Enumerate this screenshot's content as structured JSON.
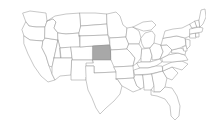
{
  "map": {
    "title": "United States map",
    "region_scope": "Contiguous United States",
    "background_color": "#ffffff",
    "state_fill_color": "#ffffff",
    "state_border_color": "#9a9a9a",
    "highlight_fill_color": "#a8a8a8",
    "highlight_border_color": "#8d8d8d",
    "shadow_color": "#7c7c7c",
    "highlighted_state": {
      "name": "Kansas",
      "abbreviation": "KS",
      "selected": true
    },
    "projection_note": "equirectangular-style flat outline",
    "states": [
      {
        "abbr": "WA",
        "name": "Washington",
        "highlighted": false
      },
      {
        "abbr": "OR",
        "name": "Oregon",
        "highlighted": false
      },
      {
        "abbr": "CA",
        "name": "California",
        "highlighted": false
      },
      {
        "abbr": "NV",
        "name": "Nevada",
        "highlighted": false
      },
      {
        "abbr": "ID",
        "name": "Idaho",
        "highlighted": false
      },
      {
        "abbr": "MT",
        "name": "Montana",
        "highlighted": false
      },
      {
        "abbr": "WY",
        "name": "Wyoming",
        "highlighted": false
      },
      {
        "abbr": "UT",
        "name": "Utah",
        "highlighted": false
      },
      {
        "abbr": "AZ",
        "name": "Arizona",
        "highlighted": false
      },
      {
        "abbr": "CO",
        "name": "Colorado",
        "highlighted": false
      },
      {
        "abbr": "NM",
        "name": "New Mexico",
        "highlighted": false
      },
      {
        "abbr": "ND",
        "name": "North Dakota",
        "highlighted": false
      },
      {
        "abbr": "SD",
        "name": "South Dakota",
        "highlighted": false
      },
      {
        "abbr": "NE",
        "name": "Nebraska",
        "highlighted": false
      },
      {
        "abbr": "KS",
        "name": "Kansas",
        "highlighted": true
      },
      {
        "abbr": "OK",
        "name": "Oklahoma",
        "highlighted": false
      },
      {
        "abbr": "TX",
        "name": "Texas",
        "highlighted": false
      },
      {
        "abbr": "MN",
        "name": "Minnesota",
        "highlighted": false
      },
      {
        "abbr": "IA",
        "name": "Iowa",
        "highlighted": false
      },
      {
        "abbr": "MO",
        "name": "Missouri",
        "highlighted": false
      },
      {
        "abbr": "AR",
        "name": "Arkansas",
        "highlighted": false
      },
      {
        "abbr": "LA",
        "name": "Louisiana",
        "highlighted": false
      },
      {
        "abbr": "WI",
        "name": "Wisconsin",
        "highlighted": false
      },
      {
        "abbr": "IL",
        "name": "Illinois",
        "highlighted": false
      },
      {
        "abbr": "MI",
        "name": "Michigan",
        "highlighted": false
      },
      {
        "abbr": "IN",
        "name": "Indiana",
        "highlighted": false
      },
      {
        "abbr": "OH",
        "name": "Ohio",
        "highlighted": false
      },
      {
        "abbr": "KY",
        "name": "Kentucky",
        "highlighted": false
      },
      {
        "abbr": "TN",
        "name": "Tennessee",
        "highlighted": false
      },
      {
        "abbr": "MS",
        "name": "Mississippi",
        "highlighted": false
      },
      {
        "abbr": "AL",
        "name": "Alabama",
        "highlighted": false
      },
      {
        "abbr": "GA",
        "name": "Georgia",
        "highlighted": false
      },
      {
        "abbr": "FL",
        "name": "Florida",
        "highlighted": false
      },
      {
        "abbr": "SC",
        "name": "South Carolina",
        "highlighted": false
      },
      {
        "abbr": "NC",
        "name": "North Carolina",
        "highlighted": false
      },
      {
        "abbr": "VA",
        "name": "Virginia",
        "highlighted": false
      },
      {
        "abbr": "WV",
        "name": "West Virginia",
        "highlighted": false
      },
      {
        "abbr": "MD",
        "name": "Maryland",
        "highlighted": false
      },
      {
        "abbr": "DE",
        "name": "Delaware",
        "highlighted": false
      },
      {
        "abbr": "PA",
        "name": "Pennsylvania",
        "highlighted": false
      },
      {
        "abbr": "NJ",
        "name": "New Jersey",
        "highlighted": false
      },
      {
        "abbr": "NY",
        "name": "New York",
        "highlighted": false
      },
      {
        "abbr": "CT",
        "name": "Connecticut",
        "highlighted": false
      },
      {
        "abbr": "RI",
        "name": "Rhode Island",
        "highlighted": false
      },
      {
        "abbr": "MA",
        "name": "Massachusetts",
        "highlighted": false
      },
      {
        "abbr": "VT",
        "name": "Vermont",
        "highlighted": false
      },
      {
        "abbr": "NH",
        "name": "New Hampshire",
        "highlighted": false
      },
      {
        "abbr": "ME",
        "name": "Maine",
        "highlighted": false
      }
    ]
  }
}
